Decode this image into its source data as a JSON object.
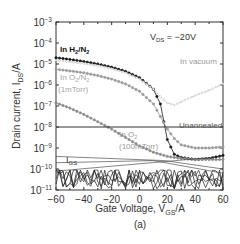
{
  "chart_data": {
    "type": "line",
    "title": "",
    "panel_label": "(a)",
    "xlabel": "Gate Voltage, V_GS/A",
    "ylabel": "Drain current, I_DS/A",
    "xlim": [
      -60,
      60
    ],
    "ylim_log10": [
      -11,
      -3
    ],
    "yscale": "log",
    "x_ticks": [
      -60,
      -40,
      -20,
      0,
      20,
      40,
      60
    ],
    "y_ticks": [
      "10^-3",
      "10^-4",
      "10^-5",
      "10^-6",
      "10^-7",
      "10^-8",
      "10^-9",
      "10^-10",
      "10^-11"
    ],
    "grid": false,
    "condition_label": "V_DS = -20V",
    "annotations": [
      "In H2/N2",
      "In O2/N2 (1mTorr)",
      "In vacuum",
      "In O2 (100mTorr)",
      "Unannealed",
      "I_GS"
    ],
    "x": [
      -60,
      -50,
      -40,
      -30,
      -20,
      -10,
      0,
      10,
      15,
      20,
      25,
      30,
      40,
      50,
      60
    ],
    "series": [
      {
        "name": "In H2/N2",
        "style": "black filled circles",
        "values_log10": [
          -4.7,
          -4.78,
          -4.88,
          -5.0,
          -5.15,
          -5.35,
          -5.65,
          -6.2,
          -6.9,
          -8.6,
          -9.3,
          -9.45,
          -9.55,
          -9.5,
          -9.35
        ]
      },
      {
        "name": "In vacuum",
        "style": "light gray open symbols",
        "values_log10": [
          -4.82,
          -4.9,
          -4.98,
          -5.08,
          -5.22,
          -5.42,
          -5.72,
          -6.2,
          -6.55,
          -6.85,
          -6.95,
          -6.8,
          -6.5,
          -6.25,
          -5.95
        ]
      },
      {
        "name": "In O2/N2 (1mTorr)",
        "style": "gray filled circles",
        "values_log10": [
          -5.25,
          -5.33,
          -5.42,
          -5.55,
          -5.72,
          -5.95,
          -6.3,
          -6.9,
          -7.5,
          -8.1,
          -8.55,
          -8.85,
          -9.0,
          -9.0,
          -8.95
        ]
      },
      {
        "name": "In O2 (100mTorr)",
        "style": "gray filled circles",
        "values_log10": [
          -6.85,
          -7.1,
          -7.4,
          -7.75,
          -8.1,
          -8.5,
          -8.9,
          -9.2,
          -9.3,
          -9.4,
          -9.45,
          -9.5,
          -9.55,
          -9.55,
          -9.55
        ]
      },
      {
        "name": "Unannealed",
        "style": "solid line",
        "values_log10": [
          -8.0,
          -8.0,
          -8.0,
          -8.0,
          -8.0,
          -8.0,
          -8.0,
          -8.0,
          -8.0,
          -8.0,
          -8.0,
          -8.0,
          -8.0,
          -8.0,
          -8.0
        ]
      },
      {
        "name": "I_GS",
        "style": "noisy black lines",
        "values_log10": [
          -10.3,
          -10.4,
          -10.3,
          -10.5,
          -10.35,
          -10.4,
          -10.3,
          -10.5,
          -10.4,
          -10.3,
          -10.4,
          -10.5,
          -10.45,
          -10.4,
          -10.5
        ]
      }
    ],
    "legend_position": "inline annotations"
  },
  "labels": {
    "vds": "V",
    "vds_sub": "DS",
    "vds_val": " = −20V",
    "h2n2": "In H",
    "h2n2_sub": "2",
    "h2n2_mid": "/N",
    "h2n2_sub2": "2",
    "o2n2": "In O",
    "o2n2_sub": "2",
    "o2n2_mid": "/N",
    "o2n2_sub2": "2",
    "o2n2_p": "(1mTorr)",
    "vacuum": "In vacuum",
    "o2": "In O",
    "o2_sub": "2",
    "o2_p": "(100mTorr)",
    "unannealed": "Unannealed",
    "igs": "I",
    "igs_sub": "GS",
    "xlabel_a": "Gate Voltage, V",
    "xlabel_sub": "GS",
    "xlabel_b": "/A",
    "ylabel_a": "Drain current, I",
    "ylabel_sub": "DS",
    "ylabel_b": "/A",
    "panel": "(a)"
  },
  "colors": {
    "h2n2": "#1a1a1a",
    "vacuum": "#b8b8b8",
    "o2n2": "#9a9a9a",
    "o2": "#8a8a8a",
    "unannealed": "#333333",
    "igs": "#222222",
    "axis": "#333333",
    "annotation_gray": "#9a9a9a"
  }
}
